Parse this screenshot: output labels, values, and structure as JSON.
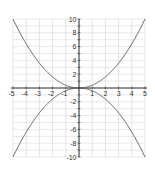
{
  "chart_data": {
    "type": "line",
    "title": "",
    "xlabel": "",
    "ylabel": "",
    "xlim": [
      -5,
      5
    ],
    "ylim": [
      -10,
      10
    ],
    "grid": true,
    "legend": null,
    "x_ticks": [
      -5,
      -4,
      -3,
      -2,
      -1,
      1,
      2,
      3,
      4,
      5
    ],
    "y_ticks": [
      10,
      8,
      6,
      4,
      2,
      -2,
      -4,
      -6,
      -8,
      -10
    ],
    "series": [
      {
        "name": "y = 0.4x^2",
        "x": [
          -5,
          -4,
          -3,
          -2,
          -1,
          0,
          1,
          2,
          3,
          4,
          5
        ],
        "y": [
          10,
          6.4,
          3.6,
          1.6,
          0.4,
          0,
          0.4,
          1.6,
          3.6,
          6.4,
          10
        ]
      },
      {
        "name": "y = -0.4x^2",
        "x": [
          -5,
          -4,
          -3,
          -2,
          -1,
          0,
          1,
          2,
          3,
          4,
          5
        ],
        "y": [
          -10,
          -6.4,
          -3.6,
          -1.6,
          -0.4,
          0,
          -0.4,
          -1.6,
          -3.6,
          -6.4,
          -10
        ]
      }
    ]
  },
  "colors": {
    "grid": "#d4d4d4",
    "axis": "#333333",
    "curve": "#555555",
    "label": "#333333"
  },
  "layout": {
    "plot_left": 13,
    "plot_right": 145,
    "plot_top": 19,
    "plot_bottom": 157
  }
}
